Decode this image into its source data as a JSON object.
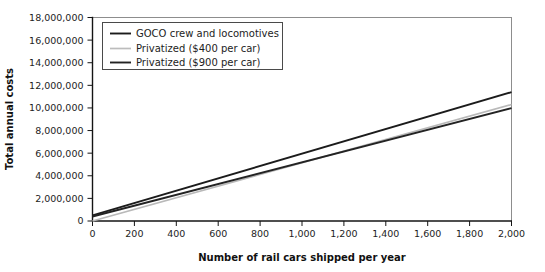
{
  "chart_data": {
    "type": "line",
    "title": "",
    "xlabel": "Number of rail cars shipped per year",
    "ylabel": "Total annual costs",
    "xlim": [
      0,
      2000
    ],
    "ylim": [
      0,
      18000000
    ],
    "grid": false,
    "legend_position": "top-left",
    "x_ticks": [
      0,
      200,
      400,
      600,
      800,
      1000,
      1200,
      1400,
      1600,
      1800,
      2000
    ],
    "x_tick_labels": [
      "0",
      "200",
      "400",
      "600",
      "800",
      "1,000",
      "1,200",
      "1,400",
      "1,600",
      "1,800",
      "2,000"
    ],
    "y_ticks": [
      0,
      2000000,
      4000000,
      6000000,
      8000000,
      10000000,
      12000000,
      14000000,
      16000000,
      18000000
    ],
    "y_tick_labels": [
      "0",
      "2,000,000",
      "4,000,000",
      "6,000,000",
      "8,000,000",
      "10,000,000",
      "12,000,000",
      "14,000,000",
      "16,000,000",
      "18,000,000"
    ],
    "x": [
      0,
      2000
    ],
    "series": [
      {
        "name": "GOCO crew and locomotives",
        "color": "#1b1b1b",
        "width": 1.9,
        "values": [
          500000,
          11400000
        ]
      },
      {
        "name": "Privatized ($400 per car)",
        "color": "#b9b9b9",
        "width": 1.7,
        "values": [
          0,
          10300000
        ]
      },
      {
        "name": "Privatized ($900 per car)",
        "color": "#232323",
        "width": 1.9,
        "values": [
          400000,
          9980000
        ]
      }
    ]
  },
  "legend": {
    "entries": [
      {
        "label": "GOCO crew and locomotives"
      },
      {
        "label": "Privatized ($400 per car)"
      },
      {
        "label": "Privatized ($900 per car)"
      }
    ]
  },
  "axes": {
    "x_title": "Number of rail cars shipped per year",
    "y_title": "Total annual costs"
  }
}
